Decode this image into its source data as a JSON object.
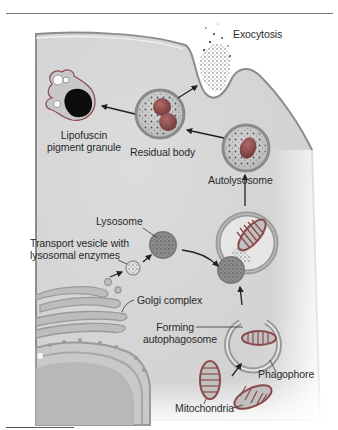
{
  "figure": {
    "type": "biological pathway diagram",
    "colors": {
      "cytoplasm": "#d6d6d6",
      "membrane": "#9a9a9a",
      "organelle_fill": "#8e8e8e",
      "organelle_red": "#8a4a4a",
      "text": "#2a2a2a"
    }
  },
  "labels": {
    "exocytosis": "Exocytosis",
    "lipofuscin_line1": "Lipofuscin",
    "lipofuscin_line2": "pigment granule",
    "residual_body": "Residual body",
    "autolysosome": "Autolysosome",
    "lysosome": "Lysosome",
    "transport_vesicle_line1": "Transport vesicle with",
    "transport_vesicle_line2": "lysosomal enzymes",
    "golgi_complex": "Golgi complex",
    "forming_line1": "Forming",
    "forming_line2": "autophagosome",
    "phagophore": "Phagophore",
    "mitochondria": "Mitochondria"
  }
}
